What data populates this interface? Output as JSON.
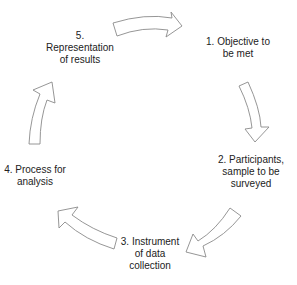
{
  "diagram": {
    "type": "cycle",
    "steps": [
      {
        "id": 1,
        "label": "1. Objective to\nbe met"
      },
      {
        "id": 2,
        "label": "2. Participants,\nsample to be\nsurveyed"
      },
      {
        "id": 3,
        "label": "3. Instrument\nof data\ncollection"
      },
      {
        "id": 4,
        "label": "4. Process for\nanalysis"
      },
      {
        "id": 5,
        "label": "5.\nRepresentation\nof results"
      }
    ],
    "edges": [
      {
        "from": 5,
        "to": 1
      },
      {
        "from": 1,
        "to": 2
      },
      {
        "from": 2,
        "to": 3
      },
      {
        "from": 3,
        "to": 4
      },
      {
        "from": 4,
        "to": 5
      }
    ],
    "colors": {
      "arrow_fill": "#ffffff",
      "arrow_stroke": "#8a8a8a",
      "text": "#222222",
      "background": "#ffffff"
    }
  }
}
